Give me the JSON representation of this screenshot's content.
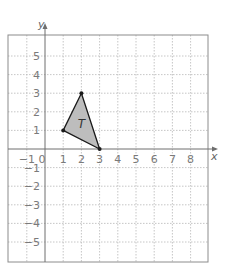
{
  "chart_data": {
    "type": "coordinate-grid",
    "title": "",
    "xlabel": "x",
    "ylabel": "y",
    "xlim": [
      -2,
      9
    ],
    "ylim": [
      -6,
      6
    ],
    "grid": true,
    "x_tick_labels": [
      "-1",
      "0",
      "1",
      "2",
      "3",
      "4",
      "5",
      "6",
      "7",
      "8"
    ],
    "y_tick_labels": [
      "5",
      "4",
      "3",
      "2",
      "1",
      "-1",
      "-2",
      "-3",
      "-4",
      "-5"
    ],
    "shapes": [
      {
        "name": "T",
        "type": "triangle",
        "vertices": [
          [
            1,
            1
          ],
          [
            2,
            3
          ],
          [
            3,
            0
          ]
        ],
        "fill": "#bdbdbd",
        "stroke": "#1a1a1a"
      }
    ]
  },
  "labels": {
    "x_axis": "x",
    "y_axis": "y",
    "shape": "T",
    "origin": "0"
  },
  "colors": {
    "grid_line": "#b8b8b8",
    "border": "#8c8c8c",
    "axis": "#6e6e6e",
    "shape_fill": "#bdbdbd",
    "shape_stroke": "#1a1a1a",
    "tick_text": "#7a7a7a"
  }
}
